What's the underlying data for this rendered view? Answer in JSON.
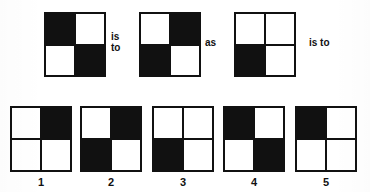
{
  "puzzle": {
    "type": "visual-analogy",
    "colors": {
      "ink": "#111111",
      "paper": "#ffffff"
    },
    "prompt_row": {
      "figures": [
        {
          "id": "term-a",
          "cells": [
            "black",
            "white",
            "white",
            "black"
          ]
        },
        {
          "id": "term-b",
          "cells": [
            "white",
            "black",
            "black",
            "white"
          ]
        },
        {
          "id": "term-c",
          "cells": [
            "white",
            "white",
            "black",
            "white"
          ]
        }
      ],
      "connectors": [
        {
          "id": "connector-is-to-1",
          "text": "is\nto"
        },
        {
          "id": "connector-as",
          "text": "as"
        },
        {
          "id": "connector-is-to-2",
          "text": "is to"
        }
      ]
    },
    "options": [
      {
        "label": "1",
        "cells": [
          "white",
          "black",
          "white",
          "white"
        ]
      },
      {
        "label": "2",
        "cells": [
          "white",
          "black",
          "black",
          "white"
        ]
      },
      {
        "label": "3",
        "cells": [
          "white",
          "white",
          "black",
          "white"
        ]
      },
      {
        "label": "4",
        "cells": [
          "black",
          "white",
          "white",
          "black"
        ]
      },
      {
        "label": "5",
        "cells": [
          "black",
          "white",
          "white",
          "white"
        ]
      }
    ]
  }
}
